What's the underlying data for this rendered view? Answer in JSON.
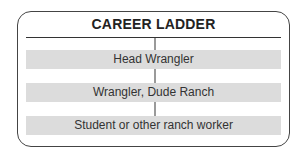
{
  "title": "CAREER LADDER",
  "levels": [
    {
      "label": "Head Wrangler"
    },
    {
      "label": "Wrangler, Dude Ranch"
    },
    {
      "label": "Student or other ranch worker"
    }
  ],
  "colors": {
    "border": "#444444",
    "bar_fill": "#dcdcdc",
    "connector": "#9a9a9a",
    "text": "#333333"
  }
}
